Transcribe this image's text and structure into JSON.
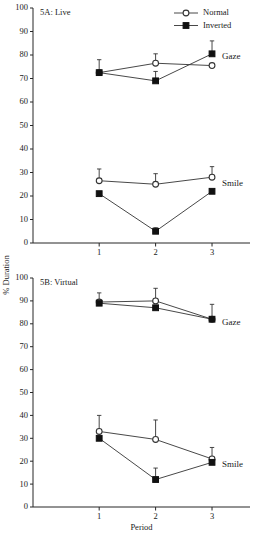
{
  "figure": {
    "ylabel": "% Duration",
    "xlabel": "Period",
    "legend": [
      {
        "label": "Normal",
        "marker": "open-circle-icon"
      },
      {
        "label": "Inverted",
        "marker": "filled-square-icon"
      }
    ]
  },
  "panels": [
    {
      "id": "5A",
      "title": "5A: Live",
      "group_labels": [
        "Gaze",
        "Smile"
      ]
    },
    {
      "id": "5B",
      "title": "5B: Virtual",
      "group_labels": [
        "Gaze",
        "Smile"
      ]
    }
  ],
  "chart_data": [
    {
      "type": "line",
      "title": "5A: Live",
      "xlabel": "Period",
      "ylabel": "% Duration",
      "ylim": [
        0,
        100
      ],
      "yticks": [
        0,
        10,
        20,
        30,
        40,
        50,
        60,
        70,
        80,
        90,
        100
      ],
      "x": [
        1,
        2,
        3
      ],
      "xticklabels": [
        "1",
        "2",
        "3"
      ],
      "grid": false,
      "legend_position": "top-right",
      "series": [
        {
          "name": "Gaze Normal",
          "group": "Gaze",
          "condition": "Normal",
          "marker": "open-circle",
          "values": [
            72.5,
            76.5,
            75.5
          ],
          "errors": [
            5.5,
            4.0,
            0.0
          ]
        },
        {
          "name": "Gaze Inverted",
          "group": "Gaze",
          "condition": "Inverted",
          "marker": "filled-square",
          "values": [
            72.5,
            69.0,
            80.5
          ],
          "errors": [
            0.0,
            4.0,
            5.5
          ]
        },
        {
          "name": "Smile Normal",
          "group": "Smile",
          "condition": "Normal",
          "marker": "open-circle",
          "values": [
            26.5,
            25.0,
            28.0
          ],
          "errors": [
            5.0,
            4.5,
            4.5
          ]
        },
        {
          "name": "Smile Inverted",
          "group": "Smile",
          "condition": "Inverted",
          "marker": "filled-square",
          "values": [
            21.0,
            5.0,
            22.0
          ],
          "errors": [
            0.0,
            1.5,
            0.0
          ]
        }
      ]
    },
    {
      "type": "line",
      "title": "5B: Virtual",
      "xlabel": "Period",
      "ylabel": "% Duration",
      "ylim": [
        0,
        100
      ],
      "yticks": [
        0,
        10,
        20,
        30,
        40,
        50,
        60,
        70,
        80,
        90,
        100
      ],
      "x": [
        1,
        2,
        3
      ],
      "xticklabels": [
        "1",
        "2",
        "3"
      ],
      "grid": false,
      "legend_position": "none",
      "series": [
        {
          "name": "Gaze Normal",
          "group": "Gaze",
          "condition": "Normal",
          "marker": "open-circle",
          "values": [
            89.5,
            90.0,
            82.0
          ],
          "errors": [
            4.0,
            5.5,
            6.5
          ]
        },
        {
          "name": "Gaze Inverted",
          "group": "Gaze",
          "condition": "Inverted",
          "marker": "filled-square",
          "values": [
            89.0,
            87.0,
            82.0
          ],
          "errors": [
            0.0,
            0.0,
            0.0
          ]
        },
        {
          "name": "Smile Normal",
          "group": "Smile",
          "condition": "Normal",
          "marker": "open-circle",
          "values": [
            33.0,
            29.5,
            21.0
          ],
          "errors": [
            7.0,
            8.5,
            5.0
          ]
        },
        {
          "name": "Smile Inverted",
          "group": "Smile",
          "condition": "Inverted",
          "marker": "filled-square",
          "values": [
            30.0,
            12.0,
            19.5
          ],
          "errors": [
            0.0,
            5.0,
            0.0
          ]
        }
      ]
    }
  ]
}
